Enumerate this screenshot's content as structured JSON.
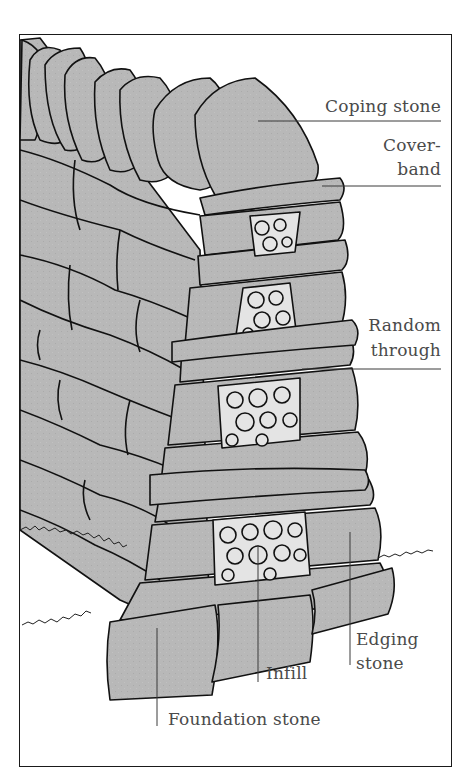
{
  "diagram": {
    "colors": {
      "stone_fill": "#b8b8b8",
      "infill_fill": "#e4e4e4",
      "outline": "#111111",
      "label_text": "#4a4a4a",
      "leader_line": "#3a3a3a",
      "frame": "#1a1a1a"
    },
    "labels": [
      {
        "id": "coping-stone",
        "line1": "Coping stone",
        "line2": ""
      },
      {
        "id": "cover-band",
        "line1": "Cover-",
        "line2": "band"
      },
      {
        "id": "random-through",
        "line1": "Random",
        "line2": "through"
      },
      {
        "id": "edging-stone",
        "line1": "Edging",
        "line2": "stone"
      },
      {
        "id": "infill",
        "line1": "Infill",
        "line2": ""
      },
      {
        "id": "foundation-stone",
        "line1": "Foundation stone",
        "line2": ""
      }
    ]
  }
}
